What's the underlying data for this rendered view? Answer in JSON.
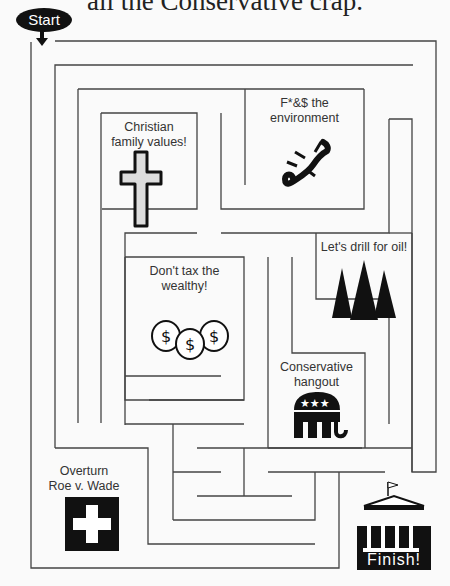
{
  "title": "all the Conservative crap.",
  "start": {
    "label": "Start"
  },
  "finish": {
    "label": "Finish!"
  },
  "rooms": [
    {
      "id": "christian",
      "lines": [
        "Christian",
        "family values!"
      ],
      "icon": "cross-icon"
    },
    {
      "id": "environment",
      "lines": [
        "F*&$ the",
        "environment"
      ],
      "icon": "lizard-icon"
    },
    {
      "id": "oil",
      "lines": [
        "Let's drill for oil!"
      ],
      "icon": "pine-trees-icon"
    },
    {
      "id": "tax",
      "lines": [
        "Don't tax the",
        "wealthy!"
      ],
      "icon": "money-bags-icon"
    },
    {
      "id": "hangout",
      "lines": [
        "Conservative",
        "hangout"
      ],
      "icon": "gop-elephant-icon"
    },
    {
      "id": "roe",
      "lines": [
        "Overturn",
        "Roe v. Wade"
      ],
      "icon": "medical-cross-icon"
    }
  ],
  "colors": {
    "wall": "#444444",
    "background": "#fafafa",
    "ink": "#111111"
  }
}
